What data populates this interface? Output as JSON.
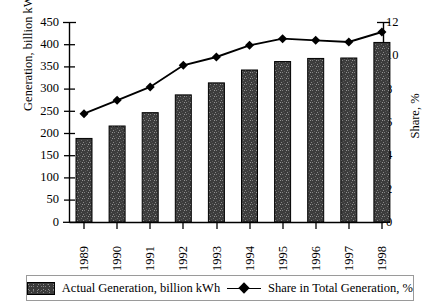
{
  "chart_data": {
    "type": "bar",
    "title": "",
    "subtitle": "",
    "xlabel": "",
    "ylabel": "Generation, billion kWh",
    "y2label": "Share, %",
    "categories": [
      "1989",
      "1990",
      "1991",
      "1992",
      "1993",
      "1994",
      "1995",
      "1996",
      "1997",
      "1998"
    ],
    "ylim": [
      0,
      450
    ],
    "y2lim": [
      0,
      12
    ],
    "yticks": [
      0,
      50,
      100,
      150,
      200,
      250,
      300,
      350,
      400,
      450
    ],
    "y2ticks": [
      0,
      2,
      4,
      6,
      8,
      10,
      12
    ],
    "grid": false,
    "legend_position": "bottom",
    "series": [
      {
        "name": "Actual Generation, billion kWh",
        "type": "bar",
        "axis": "left",
        "color": "#3a3a3a",
        "values": [
          188,
          216,
          246,
          286,
          313,
          342,
          361,
          368,
          369,
          404
        ]
      },
      {
        "name": "Share in Total Generation, %",
        "type": "line",
        "axis": "right",
        "color": "#000000",
        "marker": "diamond",
        "values": [
          6.5,
          7.3,
          8.1,
          9.4,
          9.9,
          10.6,
          11.0,
          10.9,
          10.8,
          11.4
        ]
      }
    ]
  },
  "axes": {
    "left_title": "Generation, billion kWh",
    "right_title": "Share, %",
    "left_ticks": [
      "450",
      "400",
      "350",
      "300",
      "250",
      "200",
      "150",
      "100",
      "50",
      "0"
    ],
    "right_ticks": [
      "12",
      "10",
      "8",
      "6",
      "4",
      "2",
      "0"
    ],
    "x_ticks": [
      "1989",
      "1990",
      "1991",
      "1992",
      "1993",
      "1994",
      "1995",
      "1996",
      "1997",
      "1998"
    ]
  },
  "legend": {
    "bar_label": "Actual Generation, billion kWh",
    "line_label": "Share in Total Generation, %"
  }
}
